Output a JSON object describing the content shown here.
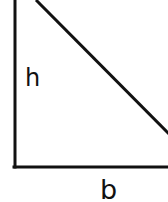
{
  "diagram": {
    "type": "right-triangle",
    "stroke_color": "#111111",
    "background": "#ffffff",
    "labels": {
      "height": "h",
      "base": "b"
    }
  }
}
